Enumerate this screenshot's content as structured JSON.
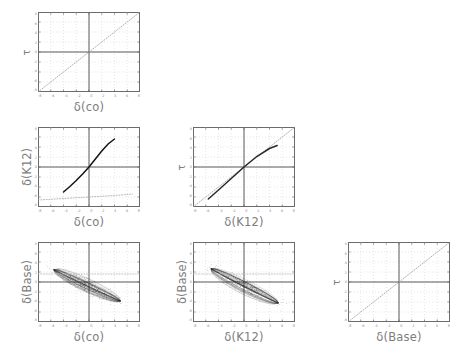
{
  "figure": {
    "kind": "scatter-plot-matrix",
    "background": "#ffffff",
    "axis_color": "#6b6b6b",
    "label_color": "#7d7d7d",
    "grid_color": "#cfcfcf",
    "crosshair_color": "#5a5a5a",
    "data_dark": "#1a1a1a",
    "data_light": "#9a9a9a"
  },
  "variables": {
    "co": "δ(co)",
    "k12": "δ(K12)",
    "base": "δ(Base)",
    "tau": "τ"
  },
  "axis": {
    "min": -8,
    "max": 8,
    "ticks": [
      -8,
      -6,
      -4,
      -2,
      0,
      2,
      4,
      6,
      8
    ],
    "tick_labels": [
      "-8",
      "-6",
      "-4",
      "-2",
      "0",
      "2",
      "4",
      "6",
      "8"
    ],
    "ytick_labels": [
      "8",
      "6",
      "4",
      "2",
      "0",
      "-2",
      "-4",
      "-6",
      "-8"
    ]
  },
  "chart_data": {
    "type": "scatter",
    "title": "",
    "xlabel": "",
    "ylabel": "",
    "xlim": [
      -8,
      8
    ],
    "ylim": [
      -8,
      8
    ],
    "grid": true,
    "legend": "none",
    "panels": [
      {
        "id": "tau-vs-co",
        "row": 1,
        "col": 1,
        "xlabel": "δ(co)",
        "ylabel": "τ",
        "series": [
          {
            "name": "identity-dotted",
            "style": "dotted",
            "color": "#9a9a9a",
            "x": [
              -8,
              -6,
              -4,
              -2,
              0,
              2,
              4,
              6,
              8
            ],
            "y": [
              -8,
              -6,
              -4,
              -2,
              0,
              2,
              4,
              6,
              8
            ]
          }
        ]
      },
      {
        "id": "k12-vs-co",
        "row": 2,
        "col": 1,
        "xlabel": "δ(co)",
        "ylabel": "δ(K12)",
        "series": [
          {
            "name": "s-curve-dark",
            "style": "solid",
            "color": "#141414",
            "x": [
              -4.0,
              -3.0,
              -2.0,
              -1.0,
              0.0,
              1.0,
              2.0,
              3.0,
              4.0
            ],
            "y": [
              -5.0,
              -3.9,
              -2.7,
              -1.4,
              0.0,
              1.6,
              3.2,
              4.6,
              5.6
            ]
          },
          {
            "name": "flat-dotted",
            "style": "dotted",
            "color": "#a8a8a8",
            "x": [
              -8.0,
              -4.0,
              0.0,
              4.0,
              6.8
            ],
            "y": [
              -6.6,
              -6.3,
              -6.0,
              -5.7,
              -5.4
            ]
          }
        ]
      },
      {
        "id": "tau-vs-k12",
        "row": 2,
        "col": 2,
        "xlabel": "δ(K12)",
        "ylabel": "τ",
        "series": [
          {
            "name": "identity-dotted",
            "style": "dotted",
            "color": "#9a9a9a",
            "x": [
              -8,
              -6,
              -4,
              -2,
              0,
              2,
              4,
              6,
              8
            ],
            "y": [
              -8,
              -6,
              -4,
              -2,
              0,
              2,
              4,
              6,
              8
            ]
          },
          {
            "name": "s-curve-dark",
            "style": "solid",
            "color": "#2a2a2a",
            "x": [
              -5.6,
              -4.0,
              -2.0,
              0.0,
              2.0,
              4.0,
              5.2
            ],
            "y": [
              -6.4,
              -4.6,
              -2.3,
              0.0,
              2.1,
              3.7,
              4.3
            ]
          }
        ]
      },
      {
        "id": "base-vs-co",
        "row": 3,
        "col": 1,
        "xlabel": "δ(co)",
        "ylabel": "δ(Base)",
        "series": [
          {
            "name": "ellipse-cloud",
            "style": "cloud",
            "color": "#2b2b2b",
            "center_x": -0.3,
            "center_y": -0.8,
            "semi_major": 6.1,
            "semi_minor": 1.25,
            "angle_deg": -31,
            "correlation": -0.93
          },
          {
            "name": "reference-dotted-horizontal",
            "style": "dotted",
            "color": "#b5b5b5",
            "x": [
              -8,
              8
            ],
            "y": [
              1.6,
              1.6
            ]
          }
        ]
      },
      {
        "id": "base-vs-k12",
        "row": 3,
        "col": 2,
        "xlabel": "δ(K12)",
        "ylabel": "δ(Base)",
        "series": [
          {
            "name": "ellipse-cloud",
            "style": "cloud",
            "color": "#2b2b2b",
            "center_x": 0.1,
            "center_y": -0.9,
            "semi_major": 6.3,
            "semi_minor": 1.3,
            "angle_deg": -33,
            "correlation": -0.92
          },
          {
            "name": "reference-dotted-horizontal",
            "style": "dotted",
            "color": "#b5b5b5",
            "x": [
              -8,
              8
            ],
            "y": [
              1.6,
              1.6
            ]
          }
        ]
      },
      {
        "id": "tau-vs-base",
        "row": 3,
        "col": 3,
        "xlabel": "δ(Base)",
        "ylabel": "τ",
        "series": [
          {
            "name": "identity-dotted",
            "style": "dotted",
            "color": "#9a9a9a",
            "x": [
              -8,
              -6,
              -4,
              -2,
              0,
              2,
              4,
              6,
              8
            ],
            "y": [
              -8,
              -6,
              -4,
              -2,
              0,
              2,
              4,
              6,
              8
            ]
          }
        ]
      }
    ]
  }
}
